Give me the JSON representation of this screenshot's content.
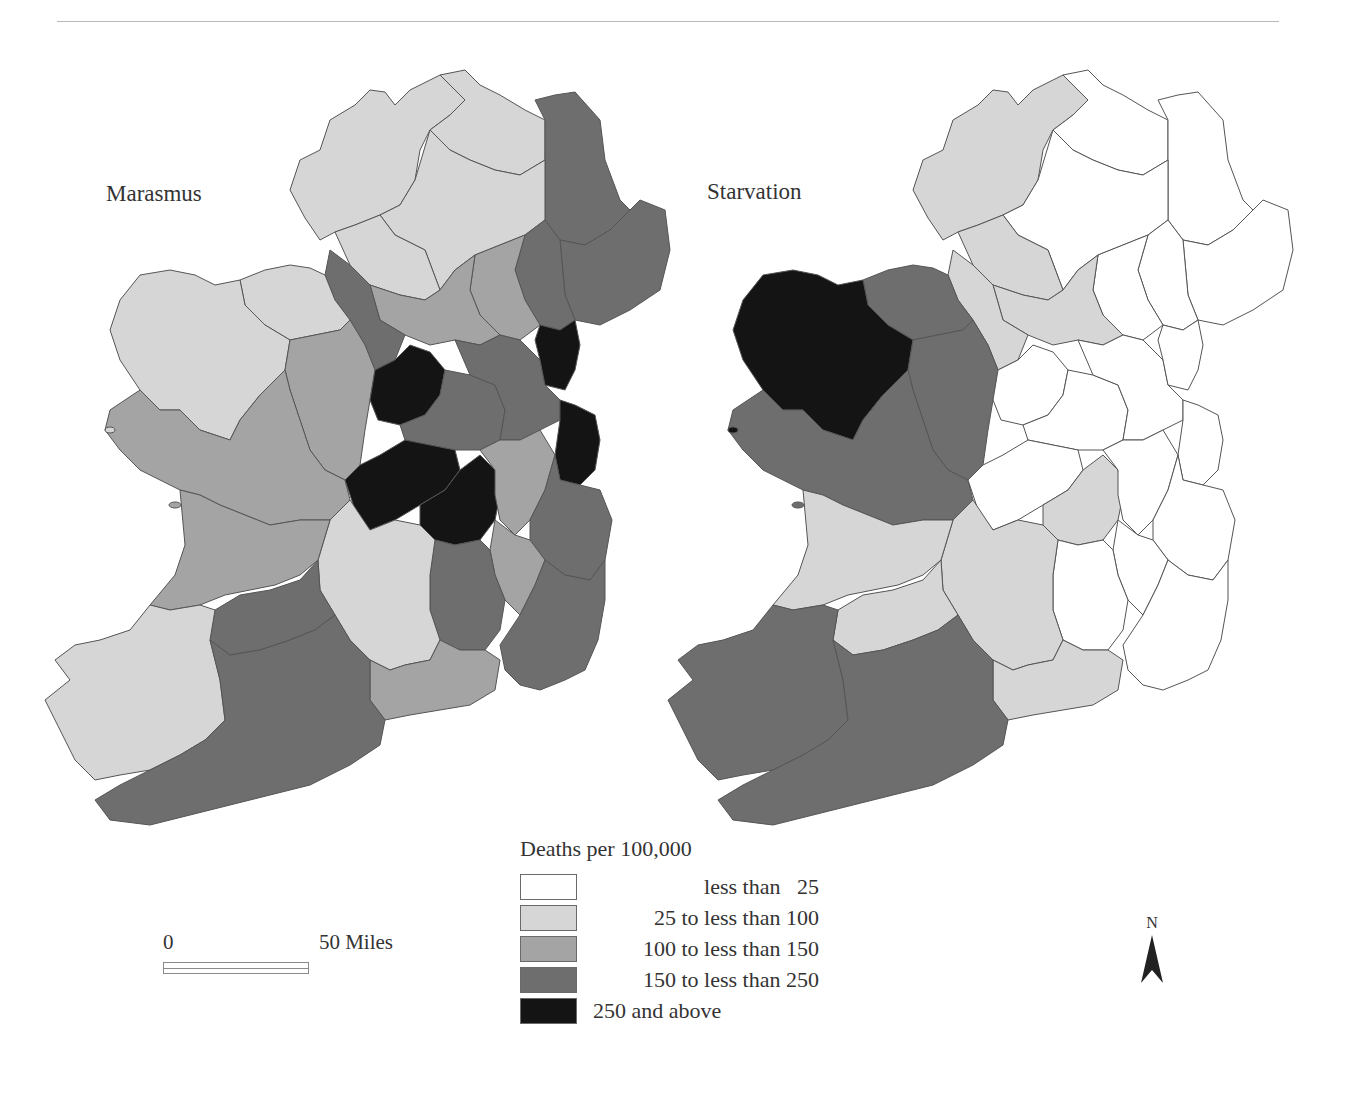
{
  "figure": {
    "title": "",
    "maps": [
      {
        "id": "marasmus",
        "title": "Marasmus"
      },
      {
        "id": "starvation",
        "title": "Starvation"
      }
    ]
  },
  "legend": {
    "title": "Deaths per 100,000",
    "items": [
      {
        "label": "less than   25",
        "color": "#ffffff"
      },
      {
        "label": "25 to less than 100",
        "color": "#d6d6d6"
      },
      {
        "label": "100 to less than 150",
        "color": "#a4a4a4"
      },
      {
        "label": "150 to less than 250",
        "color": "#6e6e6e"
      },
      {
        "label": "250 and above",
        "color": "#141414"
      }
    ]
  },
  "scale_bar": {
    "start_label": "0",
    "end_label": "50 Miles"
  },
  "north_arrow": {
    "label": "N"
  },
  "colors": {
    "class_0": "#ffffff",
    "class_1": "#d6d6d6",
    "class_2": "#a4a4a4",
    "class_3": "#6e6e6e",
    "class_4": "#141414",
    "border": "#5a5a5a"
  }
}
